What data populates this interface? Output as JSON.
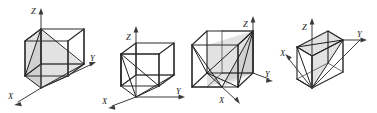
{
  "figure": {
    "type": "crystallographic-plane-diagrams",
    "background_color": "#ffffff",
    "edge_color": "#2b2b2b",
    "plane_fill_color": "#b9b9b9",
    "axis_color": "#3a3a3a",
    "label_color": "#1a1a1a",
    "panel_count": 4
  },
  "panels": [
    {
      "id": "panel-1",
      "name": "cube-diagram-1",
      "axes": {
        "z": {
          "label": "Z",
          "direction": "up"
        },
        "y": {
          "label": "Y",
          "direction": "right"
        },
        "x": {
          "label": "X",
          "direction": "down-left"
        }
      },
      "plane": {
        "shape": "triangle",
        "shaded": true,
        "description": "triangular plane on left face region"
      }
    },
    {
      "id": "panel-2",
      "name": "cube-diagram-2",
      "axes": {
        "z": {
          "label": "Z",
          "direction": "up"
        },
        "y": {
          "label": "Y",
          "direction": "right"
        },
        "x": {
          "label": "X",
          "direction": "down-left"
        }
      },
      "plane": {
        "shape": "triangle-fan",
        "shaded": false,
        "description": "lines radiating from upper-left-front vertex to bottom vertices"
      }
    },
    {
      "id": "panel-3",
      "name": "cube-diagram-3",
      "axes": {
        "z": {
          "label": "Z",
          "direction": "up"
        },
        "y": {
          "label": "Y",
          "direction": "right"
        },
        "x": {
          "label": "X",
          "direction": "down-left"
        }
      },
      "plane": {
        "shape": "triangle",
        "shaded": true,
        "description": "shaded triangle from top-right vertex to bottom front edge"
      }
    },
    {
      "id": "panel-4",
      "name": "cube-diagram-4",
      "axes": {
        "z": {
          "label": "Z",
          "direction": "up"
        },
        "y": {
          "label": "Y",
          "direction": "right"
        },
        "x": {
          "label": "X",
          "direction": "down-left"
        }
      },
      "plane": {
        "shape": "triangle-fan",
        "shaded": true,
        "description": "shaded triangles on top face radiating to top-right vertex"
      }
    }
  ],
  "labels": {
    "z": "Z",
    "y": "Y",
    "x": "X"
  }
}
